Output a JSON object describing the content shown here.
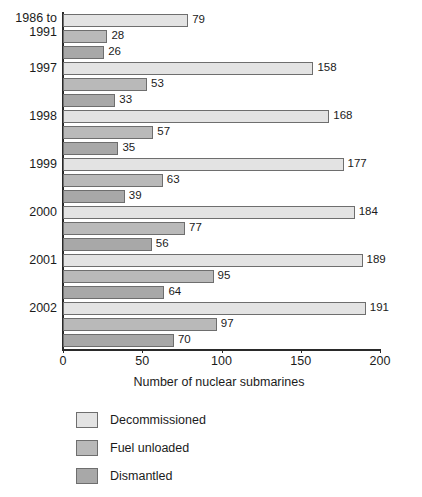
{
  "chart_data": {
    "type": "bar",
    "orientation": "horizontal",
    "grouped": true,
    "title": "",
    "xlabel": "Number of nuclear submarines",
    "ylabel": "",
    "xlim": [
      0,
      200
    ],
    "xticks": [
      0,
      50,
      100,
      150,
      200
    ],
    "xtick_labels": [
      "0",
      "50",
      "100",
      "150",
      "200"
    ],
    "grid": false,
    "legend_position": "below-left",
    "categories": [
      "1986 to\n1991",
      "1997",
      "1998",
      "1999",
      "2000",
      "2001",
      "2002"
    ],
    "series": [
      {
        "name": "Decommissioned",
        "color": "#e3e3e3",
        "values": [
          79,
          158,
          168,
          177,
          184,
          189,
          191
        ]
      },
      {
        "name": "Fuel unloaded",
        "color": "#b9b9b9",
        "values": [
          28,
          53,
          57,
          63,
          77,
          95,
          97
        ]
      },
      {
        "name": "Dismantled",
        "color": "#a8a8a8",
        "values": [
          26,
          33,
          35,
          39,
          56,
          64,
          70
        ]
      }
    ],
    "value_labels": [
      [
        "79",
        "28",
        "26"
      ],
      [
        "158",
        "53",
        "33"
      ],
      [
        "168",
        "57",
        "35"
      ],
      [
        "177",
        "63",
        "39"
      ],
      [
        "184",
        "77",
        "56"
      ],
      [
        "189",
        "95",
        "64"
      ],
      [
        "191",
        "97",
        "70"
      ]
    ]
  },
  "legend": {
    "items": [
      {
        "label": "Decommissioned",
        "color": "#e3e3e3"
      },
      {
        "label": "Fuel unloaded",
        "color": "#b9b9b9"
      },
      {
        "label": "Dismantled",
        "color": "#a8a8a8"
      }
    ]
  },
  "axis": {
    "x_title": "Number of nuclear submarines"
  }
}
